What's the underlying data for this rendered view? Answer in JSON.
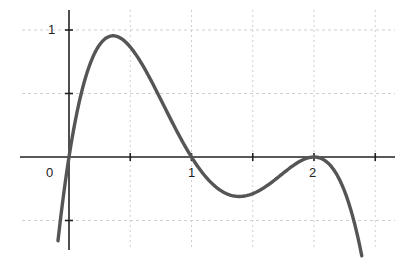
{
  "chart_data": {
    "type": "line",
    "title": "",
    "xlabel": "",
    "ylabel": "",
    "xlim": [
      -0.4,
      2.65
    ],
    "ylim": [
      -0.72,
      1.16
    ],
    "x_ticks": [
      0,
      0.5,
      1,
      1.5,
      2,
      2.5
    ],
    "x_tick_labels": [
      {
        "value": 0,
        "label": "0"
      },
      {
        "value": 1,
        "label": "1"
      },
      {
        "value": 2,
        "label": "2"
      }
    ],
    "y_ticks": [
      -0.5,
      0.5,
      1
    ],
    "y_tick_labels": [
      {
        "value": 1,
        "label": "1"
      }
    ],
    "grid": true,
    "legend": null,
    "series": [
      {
        "name": "f(x)",
        "formula": "-1.54*x*(x-1)*(x-2)^2",
        "color": "#555555",
        "x_range": [
          -0.09,
          2.39
        ],
        "key_points": [
          {
            "x": -0.09,
            "y": -0.66,
            "note": "left end"
          },
          {
            "x": 0,
            "y": 0,
            "note": "root"
          },
          {
            "x": 0.36,
            "y": 0.94,
            "note": "local max"
          },
          {
            "x": 1,
            "y": 0,
            "note": "root"
          },
          {
            "x": 1.4,
            "y": -0.3,
            "note": "local min"
          },
          {
            "x": 2,
            "y": 0,
            "note": "double root (tangent)"
          },
          {
            "x": 2.39,
            "y": -0.78,
            "note": "right end"
          }
        ]
      }
    ]
  },
  "labels": {
    "origin": "0",
    "x1": "1",
    "x2": "2",
    "y1": "1"
  },
  "colors": {
    "curve": "#555555",
    "axis": "#222222",
    "grid": "#cfcfcf"
  }
}
